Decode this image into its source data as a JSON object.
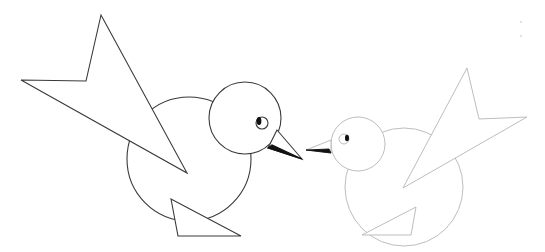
{
  "scene": {
    "description": "Two geometric line-art birds facing each other",
    "background": "#ffffff",
    "birds": [
      {
        "name": "left-bird",
        "stroke": "#3a3a3a",
        "facing": "right",
        "wing": "101,15 86,81 21,80 187,173",
        "body": {
          "cx": 189,
          "cy": 159,
          "r": 62
        },
        "head": {
          "cx": 245,
          "cy": 118,
          "r": 36
        },
        "eye": {
          "cx": 262,
          "cy": 123,
          "r": 6,
          "pupil_cx": 259,
          "pupil_cy": 121
        },
        "beak_upper": "277,130 302,159 268,148",
        "beak_lower": "268,148 302,159 272,145",
        "foot": "171,199 178,236 241,236"
      },
      {
        "name": "right-bird",
        "stroke": "#b5b5b5",
        "facing": "left",
        "wing": "467,68 479,119 527,117 403,188",
        "body": {
          "cx": 404,
          "cy": 187,
          "r": 59
        },
        "head": {
          "cx": 358,
          "cy": 144,
          "r": 27
        },
        "eye": {
          "cx": 344,
          "cy": 139,
          "r": 5,
          "pupil_cx": 347,
          "pupil_cy": 138
        },
        "beak_upper": "331,140 306,150 331,153",
        "beak_lower": "306,150 331,153 329,149",
        "foot": "416,207 411,235 362,235"
      }
    ]
  }
}
